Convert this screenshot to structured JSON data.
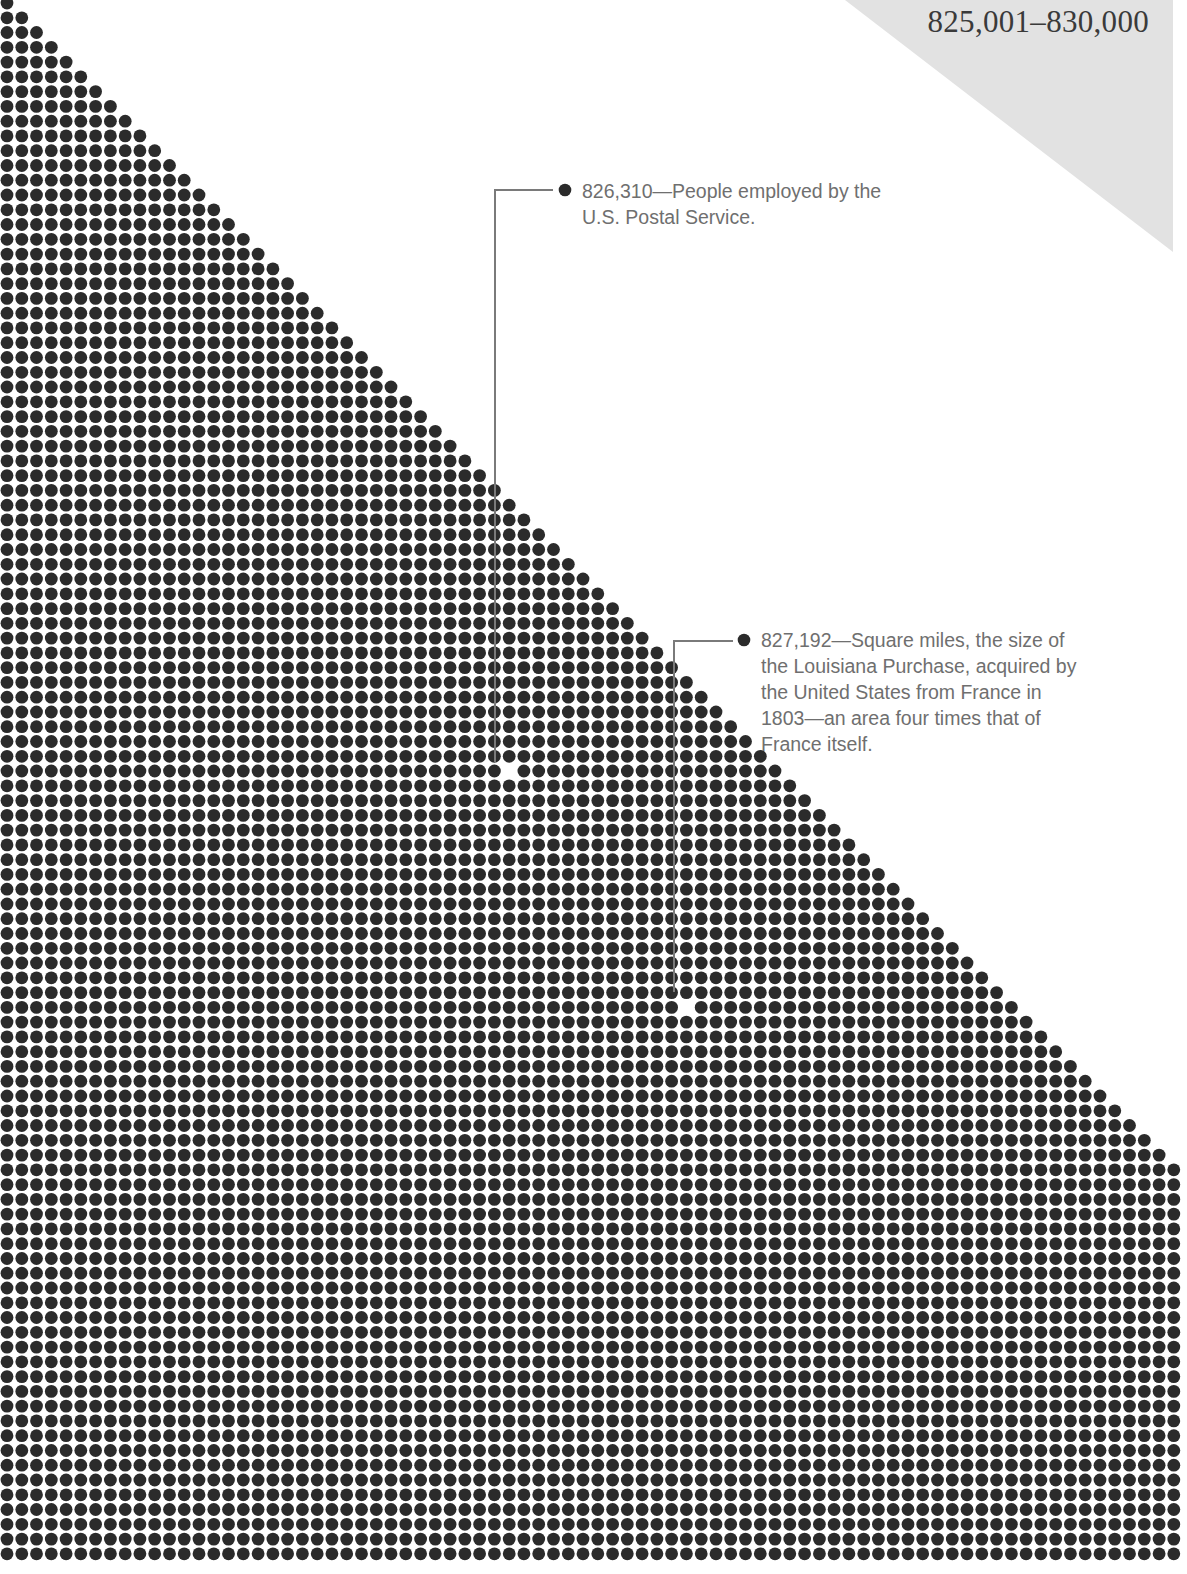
{
  "header": {
    "range_title": "825,001–830,000"
  },
  "annotations": [
    {
      "value": "826,310",
      "text": "826,310—People employed by the U.S. Postal Service.",
      "line1": "826,310—People employed by the",
      "line2": "U.S. Postal Service.",
      "marker": {
        "col": 34,
        "row": 52
      }
    },
    {
      "value": "827,192",
      "text": "827,192—Square miles, the size of the Louisiana Purchase, acquired by the United States from France in 1803—an area four times that of France itself.",
      "line1": "827,192—Square miles, the size of",
      "line2": "the Louisiana Purchase, acquired by",
      "line3": "the United States from France in",
      "line4": "1803—an area four times that of",
      "line5": "France itself.",
      "marker": {
        "col": 46,
        "row": 68
      }
    }
  ],
  "colors": {
    "dot": "#2b2b2b",
    "shade": "#e2e2e2",
    "leader": "#7a7a7a",
    "text": "#6f6f6f",
    "title": "#3a3a3a"
  },
  "chart_data": {
    "type": "dot-matrix",
    "title": "825,001–830,000",
    "grid": {
      "columns": 80,
      "rows": 106,
      "origin_x": 7,
      "origin_y": 3,
      "pitch": 14.77,
      "dot_radius": 6.4,
      "fill_rule": "row r contains min(r+1, columns) dots, left-aligned"
    },
    "highlights": [
      {
        "value": 826310,
        "label": "People employed by the U.S. Postal Service."
      },
      {
        "value": 827192,
        "label": "Square miles, the size of the Louisiana Purchase, acquired by the United States from France in 1803—an area four times that of France itself."
      }
    ],
    "range": [
      825001,
      830000
    ]
  }
}
